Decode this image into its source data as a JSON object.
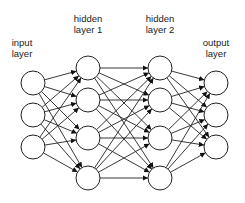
{
  "diagram": {
    "layers": [
      {
        "label": "input\nlayer",
        "x": 33,
        "label_x": 22,
        "label_y": 37,
        "nodes": [
          83,
          115,
          147
        ]
      },
      {
        "label": "hidden\nlayer 1",
        "x": 88,
        "label_x": 88,
        "label_y": 13,
        "nodes": [
          68,
          100,
          138,
          178
        ]
      },
      {
        "label": "hidden\nlayer 2",
        "x": 160,
        "label_x": 160,
        "label_y": 13,
        "nodes": [
          68,
          100,
          138,
          178
        ]
      },
      {
        "label": "output\nlayer",
        "x": 216,
        "label_x": 216,
        "label_y": 37,
        "nodes": [
          83,
          115,
          147
        ]
      }
    ],
    "node_radius": 12,
    "stroke_color": "#222222",
    "connections": "fully-connected"
  }
}
